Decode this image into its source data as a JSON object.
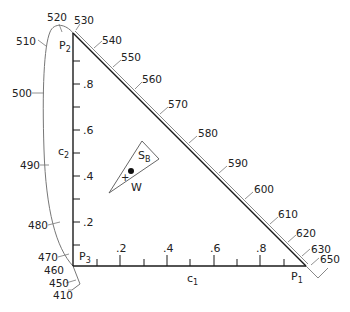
{
  "diagram": {
    "vertices": {
      "p1": "P",
      "p1_sub": "1",
      "p2": "P",
      "p2_sub": "2",
      "p3": "P",
      "p3_sub": "3"
    },
    "axes": {
      "x_label": "c",
      "x_label_sub": "1",
      "y_label": "c",
      "y_label_sub": "2",
      "x_ticks": [
        ".2",
        ".4",
        ".6",
        ".8"
      ],
      "y_ticks": [
        ".8",
        ".6",
        ".4",
        ".2"
      ]
    },
    "spectral_locus_wavelengths_left": [
      "520",
      "510",
      "500",
      "490",
      "480",
      "470",
      "460",
      "450",
      "410"
    ],
    "spectral_locus_wavelengths_hyp": [
      "530",
      "540",
      "550",
      "560",
      "570",
      "580",
      "590",
      "600",
      "610",
      "620",
      "630",
      "650"
    ],
    "region": {
      "label": "S",
      "label_sub": "B",
      "white_label": "W"
    },
    "colors": {
      "line": "#1a1a1a",
      "locus": "#777777"
    }
  }
}
